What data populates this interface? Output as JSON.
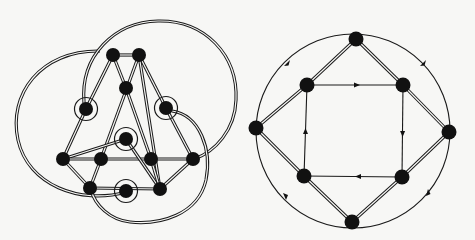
{
  "figure": {
    "panels": [
      {
        "id": "left",
        "label": "Graph with double-line edges and ringed vertices",
        "node_count": 13,
        "ringed_node_count": 4,
        "large_arc_count": 3
      },
      {
        "id": "right",
        "label": "Octagon graph with directed inner square and directed outer circle",
        "node_count": 8,
        "inner_square_direction": "clockwise",
        "outer_circle_arrows": 4
      }
    ]
  },
  "colors": {
    "background": "#f7f7f5",
    "ink": "#111111"
  }
}
